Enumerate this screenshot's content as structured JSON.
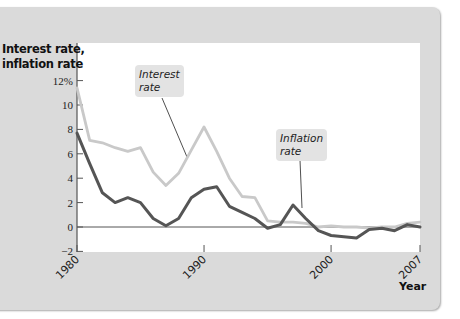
{
  "chart_data": {
    "type": "line",
    "title": "",
    "ylabel": "Interest rate,\ninflation rate",
    "xlabel": "Year",
    "ylim": [
      -2,
      12
    ],
    "xlim": [
      1980,
      2007
    ],
    "y_ticks": [
      -2,
      0,
      2,
      4,
      6,
      8,
      10,
      12
    ],
    "y_tick_labels": [
      "−2",
      "0",
      "2",
      "4",
      "6",
      "8",
      "10",
      "12%"
    ],
    "x_ticks": [
      1980,
      1990,
      2000,
      2007
    ],
    "x_tick_labels": [
      "1980",
      "1990",
      "2000",
      "2007"
    ],
    "grid": false,
    "zero_line": true,
    "x": [
      1980,
      1981,
      1982,
      1983,
      1984,
      1985,
      1986,
      1987,
      1988,
      1989,
      1990,
      1991,
      1992,
      1993,
      1994,
      1995,
      1996,
      1997,
      1998,
      1999,
      2000,
      2001,
      2002,
      2003,
      2004,
      2005,
      2006,
      2007
    ],
    "series": [
      {
        "name": "Interest rate",
        "color": "#c9c9c9",
        "values": [
          11.4,
          7.1,
          6.9,
          6.5,
          6.2,
          6.5,
          4.5,
          3.4,
          4.4,
          6.3,
          8.2,
          6.2,
          4.0,
          2.5,
          2.4,
          0.5,
          0.4,
          0.4,
          0.3,
          0.0,
          0.1,
          0.0,
          0.0,
          -0.1,
          0.0,
          0.0,
          0.3,
          0.4
        ]
      },
      {
        "name": "Inflation rate",
        "color": "#555555",
        "values": [
          7.7,
          5.2,
          2.8,
          2.0,
          2.4,
          2.0,
          0.7,
          0.1,
          0.7,
          2.4,
          3.1,
          3.3,
          1.7,
          1.2,
          0.7,
          -0.1,
          0.2,
          1.8,
          0.7,
          -0.3,
          -0.7,
          -0.8,
          -0.9,
          -0.2,
          -0.1,
          -0.3,
          0.2,
          0.0
        ]
      }
    ],
    "annotations": [
      {
        "text": "Interest\nrate",
        "series": "Interest rate"
      },
      {
        "text": "Inflation\nrate",
        "series": "Inflation rate"
      }
    ]
  }
}
